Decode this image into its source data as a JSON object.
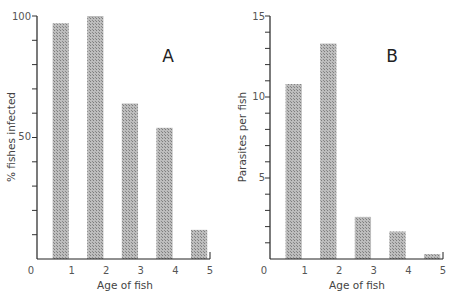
{
  "chart_data": [
    {
      "type": "bar",
      "panel": "A",
      "title": "A",
      "xlabel": "Age of fish",
      "ylabel": "% fishes infected",
      "x_tick_labels": [
        "0",
        "1",
        "2",
        "3",
        "4",
        "5"
      ],
      "y_tick_labels": [
        "100",
        "50"
      ],
      "categories": [
        "0-1",
        "1-2",
        "2-3",
        "3-4",
        "4-5"
      ],
      "values": [
        97,
        100,
        64,
        54,
        12
      ],
      "ylim": [
        0,
        100
      ],
      "xlim": [
        0,
        5
      ],
      "grid": false,
      "bar_color": "#a9a9a9"
    },
    {
      "type": "bar",
      "panel": "B",
      "title": "B",
      "xlabel": "Age of fish",
      "ylabel": "Parasites per fish",
      "x_tick_labels": [
        "0",
        "1",
        "2",
        "3",
        "4",
        "5"
      ],
      "y_tick_labels": [
        "15",
        "10",
        "5"
      ],
      "categories": [
        "0-1",
        "1-2",
        "2-3",
        "3-4",
        "4-5"
      ],
      "values": [
        10.8,
        13.3,
        2.6,
        1.7,
        0.3
      ],
      "ylim": [
        0,
        15
      ],
      "xlim": [
        0,
        5
      ],
      "grid": false,
      "bar_color": "#a9a9a9"
    }
  ]
}
